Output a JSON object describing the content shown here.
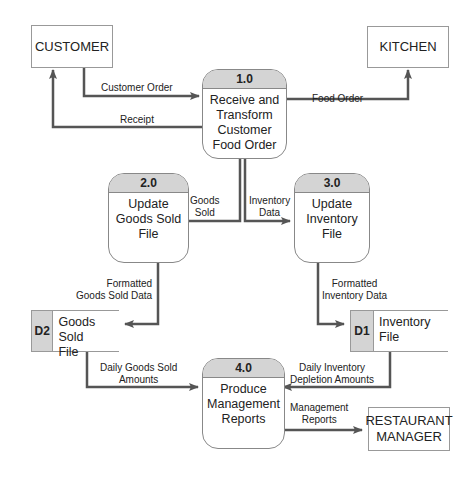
{
  "entities": {
    "customer": "CUSTOMER",
    "kitchen": "KITCHEN",
    "manager_line1": "RESTAURANT",
    "manager_line2": "MANAGER"
  },
  "processes": [
    {
      "id": "1.0",
      "lines": [
        "Receive and",
        "Transform",
        "Customer",
        "Food Order"
      ]
    },
    {
      "id": "2.0",
      "lines": [
        "Update",
        "Goods Sold",
        "File"
      ]
    },
    {
      "id": "3.0",
      "lines": [
        "Update",
        "Inventory",
        "File"
      ]
    },
    {
      "id": "4.0",
      "lines": [
        "Produce",
        "Management",
        "Reports"
      ]
    }
  ],
  "stores": [
    {
      "id": "D2",
      "lines": [
        "Goods Sold",
        "File"
      ]
    },
    {
      "id": "D1",
      "lines": [
        "Inventory",
        "File"
      ]
    }
  ],
  "flows": {
    "customer_order": "Customer Order",
    "receipt": "Receipt",
    "food_order": "Food Order",
    "goods_sold": [
      "Goods",
      "Sold"
    ],
    "inventory_data": [
      "Inventory",
      "Data"
    ],
    "formatted_goods": [
      "Formatted",
      "Goods Sold Data"
    ],
    "formatted_inventory": [
      "Formatted",
      "Inventory Data"
    ],
    "daily_goods": [
      "Daily Goods Sold",
      "Amounts"
    ],
    "daily_inventory": [
      "Daily Inventory",
      "Depletion Amounts"
    ],
    "mgmt_reports": [
      "Management",
      "Reports"
    ]
  }
}
